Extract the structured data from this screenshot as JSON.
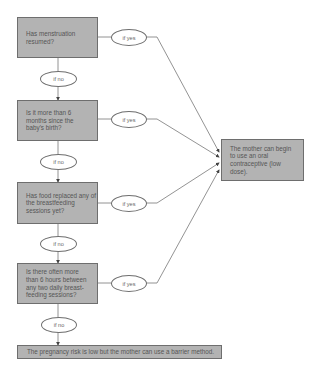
{
  "questions": [
    {
      "text": "Has menstruation resumed?",
      "yes": "if yes",
      "no": "if no"
    },
    {
      "text": "Is it more than 6 months since the baby's birth?",
      "yes": "if yes",
      "no": "if no"
    },
    {
      "text": "Has food replaced any of the breastfeeding sessions yet?",
      "yes": "if yes",
      "no": "if no"
    },
    {
      "text": "Is there often more than 6 hours between any two daily breast-feeding sessions?",
      "yes": "if yes",
      "no": "if no"
    }
  ],
  "outcome_yes": "The mother can begin to use an oral contraceptive (low dose).",
  "outcome_no": "The pregnancy risk is low but the mother can use a barrier method.",
  "colors": {
    "box_fill": "#b3b3b3",
    "line": "#6e6e6e"
  }
}
